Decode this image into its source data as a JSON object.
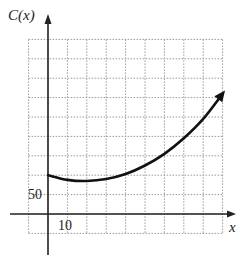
{
  "chart_data": {
    "type": "line",
    "title": "",
    "xlabel": "x",
    "ylabel": "C(x)",
    "x_tick_labels": [
      "10"
    ],
    "y_tick_labels": [
      "50"
    ],
    "x_step": 10,
    "y_step": 50,
    "xlim": [
      -10,
      90
    ],
    "ylim": [
      -50,
      450
    ],
    "grid": true,
    "grid_style": "dotted",
    "series": [
      {
        "name": "C(x)",
        "x": [
          0,
          10,
          20,
          30,
          40,
          50,
          60,
          70,
          80,
          90
        ],
        "values": [
          100,
          88,
          85,
          90,
          103,
          125,
          155,
          195,
          245,
          310
        ],
        "arrow_at_end": true
      }
    ]
  },
  "labels": {
    "y_axis": "C(x)",
    "x_axis": "x",
    "x_tick": "10",
    "y_tick": "50"
  }
}
